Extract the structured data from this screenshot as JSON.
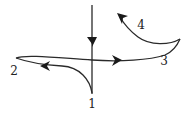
{
  "diagram": {
    "type": "trajectory-with-cusps",
    "labels": [
      {
        "id": "1",
        "text": "1",
        "x": 92,
        "y": 108
      },
      {
        "id": "2",
        "text": "2",
        "x": 14,
        "y": 75
      },
      {
        "id": "3",
        "text": "3",
        "x": 164,
        "y": 65
      },
      {
        "id": "4",
        "text": "4",
        "x": 141,
        "y": 29
      }
    ],
    "colors": {
      "stroke": "#2a2a2a",
      "background": "#ffffff"
    }
  }
}
